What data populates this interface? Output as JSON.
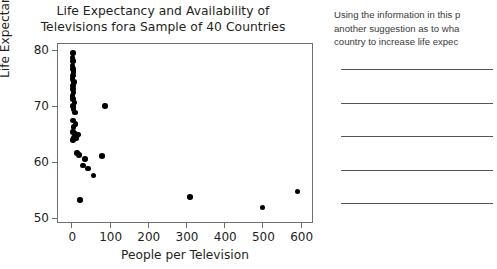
{
  "chart_data": {
    "type": "scatter",
    "title": "Life Expectancy and Availability of Televisions fora Sample of 40 Countries",
    "title_lines": [
      "Life Expectancy and Availability of",
      "Televisions fora Sample of 40 Countries"
    ],
    "xlabel": "People per Television",
    "ylabel": "Life Expectancy",
    "xlim": [
      -35,
      635
    ],
    "ylim": [
      49,
      81
    ],
    "xticks": [
      0,
      100,
      200,
      300,
      400,
      500,
      600
    ],
    "xtick_labels": [
      "0",
      "100",
      "200",
      "300",
      "400",
      "500",
      "600"
    ],
    "yticks": [
      50,
      60,
      70,
      80
    ],
    "ytick_labels": [
      "50",
      "60",
      "70",
      "80"
    ],
    "grid": false,
    "legend": "none",
    "marker_color": "#000000",
    "n_points": 40,
    "points": [
      {
        "x": 4,
        "y": 79.4
      },
      {
        "x": 3,
        "y": 78.6
      },
      {
        "x": 5,
        "y": 78.0
      },
      {
        "x": 3,
        "y": 77.2
      },
      {
        "x": 4,
        "y": 76.6
      },
      {
        "x": 6,
        "y": 76.0
      },
      {
        "x": 4,
        "y": 75.4
      },
      {
        "x": 3,
        "y": 74.8
      },
      {
        "x": 7,
        "y": 74.2
      },
      {
        "x": 5,
        "y": 73.6
      },
      {
        "x": 4,
        "y": 73.0
      },
      {
        "x": 6,
        "y": 72.4
      },
      {
        "x": 3,
        "y": 71.8
      },
      {
        "x": 5,
        "y": 71.2
      },
      {
        "x": 8,
        "y": 70.6
      },
      {
        "x": 4,
        "y": 70.0
      },
      {
        "x": 6,
        "y": 69.4
      },
      {
        "x": 9,
        "y": 68.8
      },
      {
        "x": 88,
        "y": 70.0
      },
      {
        "x": 5,
        "y": 67.4
      },
      {
        "x": 11,
        "y": 66.8
      },
      {
        "x": 6,
        "y": 66.2
      },
      {
        "x": 4,
        "y": 65.4
      },
      {
        "x": 9,
        "y": 65.0
      },
      {
        "x": 14,
        "y": 64.8
      },
      {
        "x": 18,
        "y": 64.9
      },
      {
        "x": 7,
        "y": 64.4
      },
      {
        "x": 12,
        "y": 64.2
      },
      {
        "x": 5,
        "y": 63.9
      },
      {
        "x": 80,
        "y": 61.1
      },
      {
        "x": 14,
        "y": 61.6
      },
      {
        "x": 20,
        "y": 61.3
      },
      {
        "x": 36,
        "y": 60.6
      },
      {
        "x": 30,
        "y": 59.4
      },
      {
        "x": 44,
        "y": 58.9
      },
      {
        "x": 58,
        "y": 57.6
      },
      {
        "x": 22,
        "y": 53.3
      },
      {
        "x": 310,
        "y": 53.8
      },
      {
        "x": 500,
        "y": 51.9
      },
      {
        "x": 592,
        "y": 54.8
      }
    ]
  },
  "question": {
    "lines": [
      "Using the information in this p",
      "another suggestion as to wha",
      "country to increase life  expec"
    ],
    "answer_line_count": 5
  }
}
